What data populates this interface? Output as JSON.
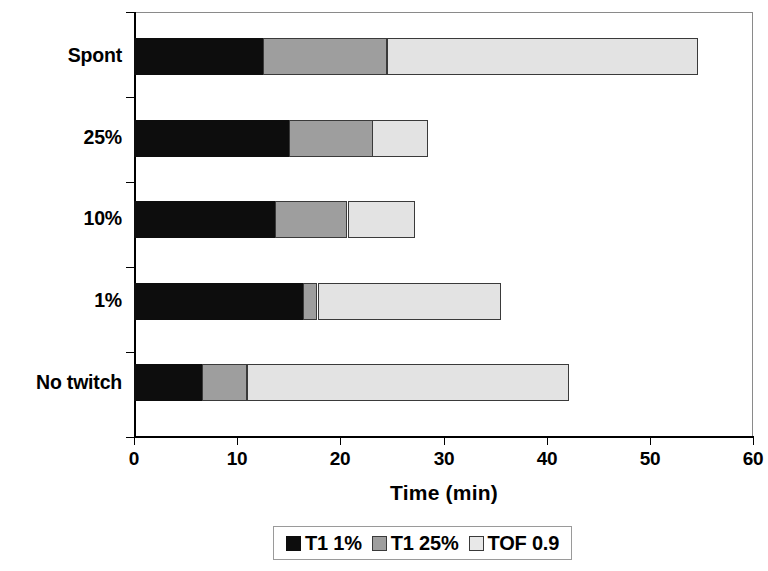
{
  "chart_data": {
    "type": "bar",
    "orientation": "horizontal",
    "stacked": true,
    "title": "",
    "xlabel": "Time (min)",
    "ylabel": "",
    "xlim": [
      0,
      60
    ],
    "xticks": [
      0,
      10,
      20,
      30,
      40,
      50,
      60
    ],
    "xtick_labels": [
      "0",
      "10",
      "20",
      "30",
      "40",
      "50",
      "60"
    ],
    "grid": false,
    "legend_position": "bottom",
    "categories": [
      "No twitch",
      "1%",
      "10%",
      "25%",
      "Spont"
    ],
    "category_order_top_to_bottom": [
      "Spont",
      "25%",
      "10%",
      "1%",
      "No twitch"
    ],
    "series": [
      {
        "name": "T1 1%",
        "color": "#0d0d0d",
        "values": [
          6.6,
          16.4,
          13.7,
          15.0,
          12.5
        ]
      },
      {
        "name": "T1 25%",
        "color": "#9e9e9e",
        "values": [
          4.4,
          1.4,
          7.0,
          8.1,
          12.0
        ]
      },
      {
        "name": "TOF 0.9",
        "color": "#e3e3e3",
        "values": [
          31.2,
          17.7,
          6.5,
          5.4,
          30.1
        ]
      }
    ],
    "cumulative_totals": [
      42.2,
      35.5,
      27.2,
      28.5,
      54.6
    ],
    "segment_boundaries": {
      "No twitch": [
        0,
        6.6,
        11.0,
        42.2
      ],
      "1%": [
        0,
        16.4,
        17.8,
        35.5
      ],
      "10%": [
        0,
        13.7,
        20.7,
        27.2
      ],
      "25%": [
        0,
        15.0,
        23.1,
        28.5
      ],
      "Spont": [
        0,
        12.5,
        24.5,
        54.6
      ]
    }
  },
  "axis": {
    "x_title": "Time (min)",
    "x_tick_labels": [
      "0",
      "10",
      "20",
      "30",
      "40",
      "50",
      "60"
    ],
    "y_tick_labels": [
      "Spont",
      "25%",
      "10%",
      "1%",
      "No twitch"
    ]
  },
  "legend": {
    "entries": [
      {
        "label": "T1 1%",
        "swatch": "black-swatch"
      },
      {
        "label": "T1 25%",
        "swatch": "gray-swatch"
      },
      {
        "label": "TOF 0.9",
        "swatch": "light-gray-swatch"
      }
    ]
  },
  "colors": {
    "series_1": "#0d0d0d",
    "series_2": "#9e9e9e",
    "series_3": "#e3e3e3",
    "axis": "#000000",
    "plot_border": "#8a8a8a",
    "background": "#ffffff"
  }
}
